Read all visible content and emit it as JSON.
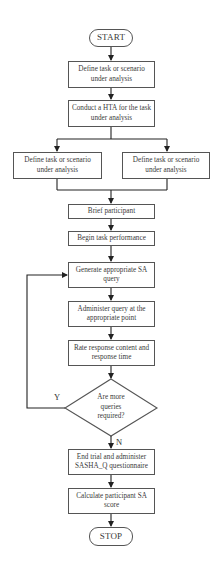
{
  "flowchart": {
    "start": "START",
    "stop": "STOP",
    "steps": {
      "define_task": "Define task or scenario under analysis",
      "conduct_hta": "Conduct a HTA for the task under analysis",
      "define_left": "Define task or scenario under analysis",
      "define_right": "Define task or scenario under analysis",
      "brief": "Brief participant",
      "begin": "Begin task performance",
      "generate": "Generate appropriate SA query",
      "administer": "Administer query at the appropriate point",
      "rate": "Rate response content and response time",
      "end_trial": "End trial and administer SASHA_Q questionnaire",
      "calculate": "Calculate participant SA score"
    },
    "decision": {
      "text": "Are more queries required?",
      "yes_label": "Y",
      "no_label": "N"
    }
  },
  "colors": {
    "line": "#222222",
    "border": "#555555",
    "text": "#3a3a3a"
  }
}
